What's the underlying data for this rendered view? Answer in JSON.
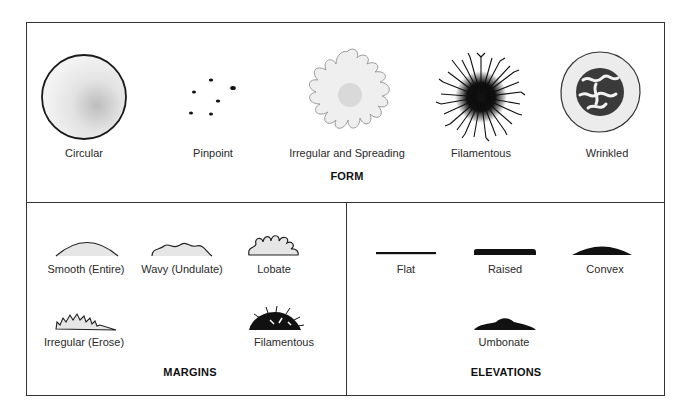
{
  "form": {
    "title": "FORM",
    "items": [
      {
        "label": "Circular",
        "icon": "circular-colony-icon"
      },
      {
        "label": "Pinpoint",
        "icon": "pinpoint-colony-icon"
      },
      {
        "label": "Irregular and Spreading",
        "icon": "irregular-spreading-colony-icon"
      },
      {
        "label": "Filamentous",
        "icon": "filamentous-colony-icon"
      },
      {
        "label": "Wrinkled",
        "icon": "wrinkled-colony-icon"
      }
    ]
  },
  "margins": {
    "title": "MARGINS",
    "items": [
      {
        "label": "Smooth (Entire)",
        "icon": "smooth-margin-icon"
      },
      {
        "label": "Wavy (Undulate)",
        "icon": "wavy-margin-icon"
      },
      {
        "label": "Lobate",
        "icon": "lobate-margin-icon"
      },
      {
        "label": "Irregular (Erose)",
        "icon": "irregular-margin-icon"
      },
      {
        "label": "Filamentous",
        "icon": "filamentous-margin-icon"
      }
    ]
  },
  "elevations": {
    "title": "ELEVATIONS",
    "items": [
      {
        "label": "Flat",
        "icon": "flat-elevation-icon"
      },
      {
        "label": "Raised",
        "icon": "raised-elevation-icon"
      },
      {
        "label": "Convex",
        "icon": "convex-elevation-icon"
      },
      {
        "label": "Umbonate",
        "icon": "umbonate-elevation-icon"
      }
    ]
  },
  "colors": {
    "line": "#222222",
    "stipple": "#d8d8d8",
    "fill_dark": "#111111"
  }
}
